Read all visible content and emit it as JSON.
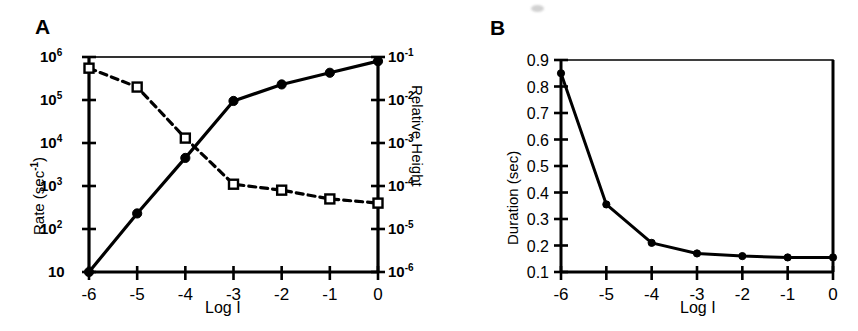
{
  "figure": {
    "panels": [
      {
        "id": "A",
        "label": "A",
        "xlabel": "Log I",
        "ylabel_left": "Rate (sec-1)",
        "ylabel_right": "Relative Height"
      },
      {
        "id": "B",
        "label": "B",
        "xlabel": "Log I",
        "ylabel_left": "Duration  (sec)"
      }
    ]
  },
  "chart_data": [
    {
      "type": "line",
      "panel": "A",
      "title": "A",
      "xlabel": "Log I",
      "ylabel": "Rate (sec-1)",
      "y2label": "Relative Height",
      "xlim": [
        -6,
        0
      ],
      "xticks": [
        -6,
        -5,
        -4,
        -3,
        -2,
        -1,
        0
      ],
      "xticklabels": [
        "-6",
        "-5",
        "-4",
        "-3",
        "-2",
        "-1",
        "0"
      ],
      "yscale": "log",
      "ylim": [
        10,
        1000000
      ],
      "yticks": [
        10,
        100,
        1000,
        10000,
        100000,
        1000000
      ],
      "yticklabels": [
        "10",
        "10^2",
        "10^3",
        "10^4",
        "10^5",
        "10^6"
      ],
      "y2scale": "log",
      "y2lim": [
        1e-06,
        0.1
      ],
      "y2ticks": [
        1e-06,
        1e-05,
        0.0001,
        0.001,
        0.01,
        0.1
      ],
      "y2ticklabels": [
        "10^-6",
        "10^-5",
        "10^-4",
        "10^-3",
        "10^-2",
        "10^-1"
      ],
      "grid": false,
      "legend": "none",
      "series": [
        {
          "name": "Rate",
          "axis": "left",
          "marker": "filled-circle",
          "linestyle": "solid",
          "x": [
            -6,
            -5,
            -4,
            -3,
            -2,
            -1,
            0
          ],
          "values": [
            10,
            230,
            4500,
            95000,
            230000,
            430000,
            800000
          ]
        },
        {
          "name": "Relative Height",
          "axis": "right",
          "marker": "open-square",
          "linestyle": "dashed",
          "x": [
            -6,
            -5,
            -4,
            -3,
            -2,
            -1,
            0
          ],
          "values": [
            0.055,
            0.02,
            0.0013,
            0.00011,
            8e-05,
            5e-05,
            4e-05
          ]
        }
      ]
    },
    {
      "type": "line",
      "panel": "B",
      "title": "B",
      "xlabel": "Log I",
      "ylabel": "Duration  (sec)",
      "xlim": [
        -6,
        0
      ],
      "xticks": [
        -6,
        -5,
        -4,
        -3,
        -2,
        -1,
        0
      ],
      "xticklabels": [
        "-6",
        "-5",
        "-4",
        "-3",
        "-2",
        "-1",
        "0"
      ],
      "yscale": "linear",
      "ylim": [
        0.1,
        0.9
      ],
      "yticks": [
        0.1,
        0.2,
        0.3,
        0.4,
        0.5,
        0.6,
        0.7,
        0.8,
        0.9
      ],
      "yticklabels": [
        "0.1",
        "0.2",
        "0.3",
        "0.4",
        "0.5",
        "0.6",
        "0.7",
        "0.8",
        "0.9"
      ],
      "grid": false,
      "legend": "none",
      "series": [
        {
          "name": "Duration",
          "axis": "left",
          "marker": "filled-circle",
          "linestyle": "solid",
          "x": [
            -6,
            -5,
            -4,
            -3,
            -2,
            -1,
            0
          ],
          "values": [
            0.85,
            0.355,
            0.21,
            0.17,
            0.16,
            0.155,
            0.155
          ]
        }
      ]
    }
  ],
  "labels": {
    "panel_a": "A",
    "panel_b": "B",
    "log_i": "Log I",
    "rate_axis": "Rate (sec",
    "rate_axis_sup": "-1",
    "rate_axis_tail": ")",
    "relative_height_axis": "Relative Height",
    "duration_axis": "Duration  (sec)",
    "a_xticks": [
      "-6",
      "-5",
      "-4",
      "-3",
      "-2",
      "-1",
      "0"
    ],
    "b_xticks": [
      "-6",
      "-5",
      "-4",
      "-3",
      "-2",
      "-1",
      "0"
    ],
    "a_left_yticks": [
      "10",
      "10",
      "10",
      "10",
      "10",
      "10"
    ],
    "a_left_ysup": [
      "6",
      "5",
      "4",
      "3",
      "2",
      ""
    ],
    "a_right_yticks": [
      "10",
      "10",
      "10",
      "10",
      "10",
      "10"
    ],
    "a_right_ysup": [
      "-1",
      "-2",
      "-3",
      "-4",
      "-5",
      "-6"
    ],
    "b_yticks": [
      "0.9",
      "0.8",
      "0.7",
      "0.6",
      "0.5",
      "0.4",
      "0.3",
      "0.2",
      "0.1"
    ]
  },
  "colors": {
    "ink": "#000000",
    "background": "#ffffff"
  }
}
